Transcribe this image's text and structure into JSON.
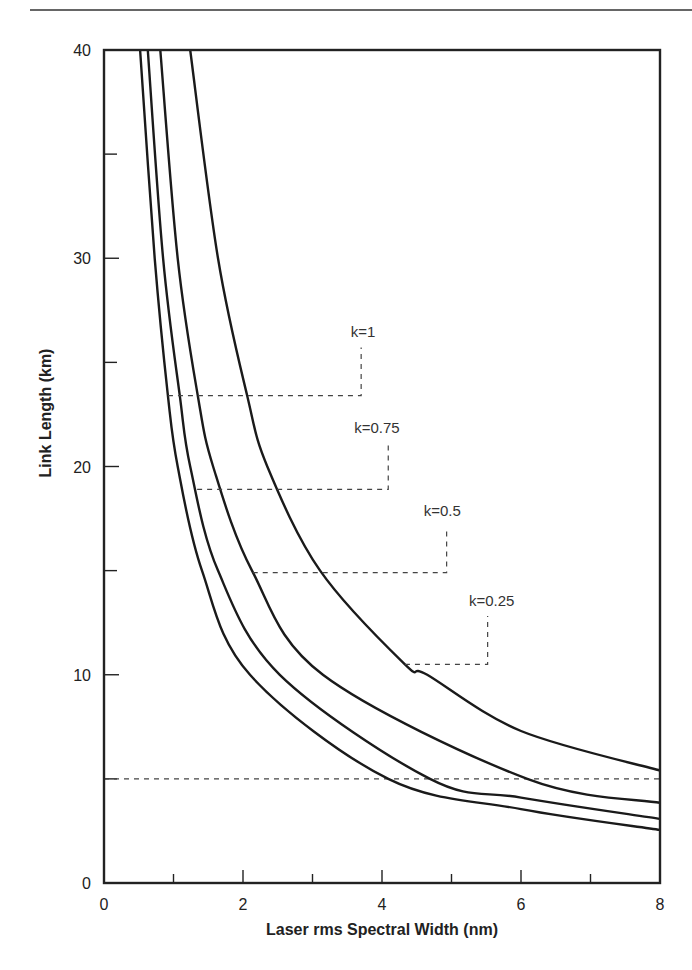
{
  "chart_data": {
    "type": "line",
    "title": "",
    "xlabel": "Laser rms Spectral Width (nm)",
    "ylabel": "Link Length (km)",
    "xlim": [
      0,
      8
    ],
    "ylim": [
      0,
      40
    ],
    "x_ticks_major": [
      0,
      2,
      4,
      6,
      8
    ],
    "x_ticks_minor": [
      1,
      3,
      5,
      7
    ],
    "x_tick_labels": [
      "0",
      "2",
      "4",
      "6",
      "8"
    ],
    "y_ticks_major": [
      0,
      10,
      20,
      30,
      40
    ],
    "y_ticks_minor": [
      5,
      15,
      25,
      35
    ],
    "y_tick_labels": [
      "0",
      "10",
      "20",
      "30",
      "40"
    ],
    "grid": false,
    "reference_line": {
      "y": 5,
      "style": "dashed",
      "label": ""
    },
    "series": [
      {
        "name": "k=1",
        "label": "k=1",
        "x": [
          1.24,
          1.64,
          2.06,
          2.35,
          3.11,
          4.33,
          4.65,
          6.0,
          8.0
        ],
        "y": [
          40,
          30,
          23.4,
          20,
          15,
          10.5,
          10,
          7.3,
          5.4
        ],
        "annotation": {
          "label_x": 3.55,
          "label_y": 26.2,
          "leader_x_start": 0.92,
          "leader_y": 23.4,
          "leader_x_end": 3.7
        }
      },
      {
        "name": "k=0.75",
        "label": "k=0.75",
        "x": [
          0.81,
          1.06,
          1.35,
          1.57,
          2.13,
          3.15,
          6.09,
          8.0
        ],
        "y": [
          40,
          30,
          23.4,
          20,
          15,
          10,
          5,
          3.85
        ],
        "annotation": {
          "label_x": 3.6,
          "label_y": 21.6,
          "leader_x_start": 1.34,
          "leader_y": 18.9,
          "leader_x_end": 4.09
        }
      },
      {
        "name": "k=0.5",
        "label": "k=0.5",
        "x": [
          0.63,
          0.85,
          1.09,
          1.24,
          1.64,
          2.53,
          4.69,
          6.0,
          8.0
        ],
        "y": [
          40,
          30,
          23.4,
          20,
          15,
          10,
          5,
          4.1,
          3.08
        ],
        "annotation": {
          "label_x": 4.6,
          "label_y": 17.6,
          "leader_x_start": 2.14,
          "leader_y": 14.9,
          "leader_x_end": 4.93
        }
      },
      {
        "name": "k=0.25",
        "label": "k=0.25",
        "x": [
          0.52,
          0.73,
          0.92,
          1.06,
          1.41,
          2.1,
          4.09,
          6.0,
          8.0
        ],
        "y": [
          40,
          30,
          23.4,
          20,
          15,
          10,
          5,
          3.55,
          2.55
        ],
        "annotation": {
          "label_x": 5.25,
          "label_y": 13.3,
          "leader_x_start": 4.33,
          "leader_y": 10.5,
          "leader_x_end": 5.52
        }
      }
    ],
    "legend": "inline annotations with dashed leader lines"
  }
}
